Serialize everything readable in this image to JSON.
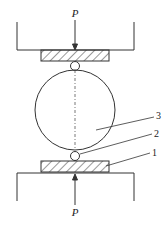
{
  "diagram": {
    "force_label_top": "P",
    "force_label_bottom": "P",
    "callouts": [
      {
        "id": "1",
        "text": "1",
        "target": "bottom-plate"
      },
      {
        "id": "2",
        "text": "2",
        "target": "small-ball"
      },
      {
        "id": "3",
        "text": "3",
        "target": "large-sphere"
      }
    ]
  }
}
